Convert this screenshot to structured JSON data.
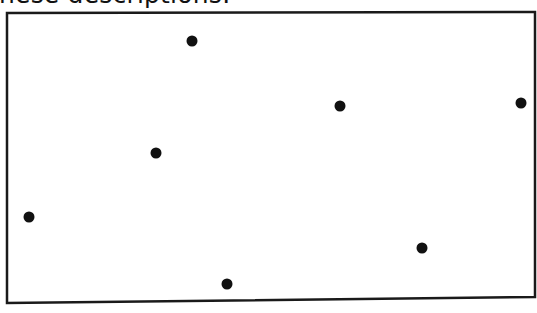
{
  "caption": {
    "text": "hese descriptions:"
  },
  "figure": {
    "frame": {
      "points": [
        [
          7,
          13
        ],
        [
          535,
          12
        ],
        [
          535,
          297
        ],
        [
          7,
          303
        ]
      ],
      "stroke": "#1a1a1a",
      "stroke_width": 2.5
    },
    "dot_color": "#111111",
    "dot_radius": 5.5,
    "dots": [
      {
        "x": 192,
        "y": 41
      },
      {
        "x": 340,
        "y": 106
      },
      {
        "x": 521,
        "y": 103
      },
      {
        "x": 156,
        "y": 153
      },
      {
        "x": 29,
        "y": 217
      },
      {
        "x": 422,
        "y": 248
      },
      {
        "x": 227,
        "y": 284
      }
    ]
  }
}
